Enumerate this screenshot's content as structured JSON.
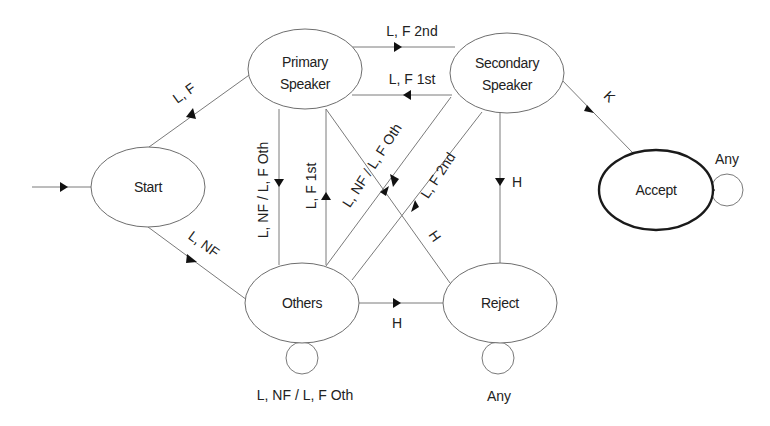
{
  "diagram": {
    "type": "state-machine",
    "nodes": {
      "start": {
        "label": "Start"
      },
      "primary": {
        "line1": "Primary",
        "line2": "Speaker"
      },
      "secondary": {
        "line1": "Secondary",
        "line2": "Speaker"
      },
      "others": {
        "label": "Others"
      },
      "reject": {
        "label": "Reject"
      },
      "accept": {
        "label": "Accept"
      }
    },
    "edges": {
      "start_to_primary": "L, F",
      "start_to_others": "L, NF",
      "primary_to_secondary": "L, F 2nd",
      "secondary_to_primary": "L, F 1st",
      "primary_to_others": "L, NF / L, F Oth",
      "others_to_primary": "L, F 1st",
      "secondary_to_others": "L, NF / L, F Oth",
      "others_to_secondary": "L, F 2nd",
      "primary_to_reject": "H",
      "secondary_to_reject": "H",
      "others_to_reject": "H",
      "secondary_to_accept": "K",
      "others_self": "L, NF / L, F Oth",
      "reject_self": "Any",
      "accept_self": "Any"
    },
    "colors": {
      "line": "#7a7a7a",
      "text": "#222222",
      "arrow": "#111111",
      "final_state_border": "#1a1a1a"
    }
  }
}
